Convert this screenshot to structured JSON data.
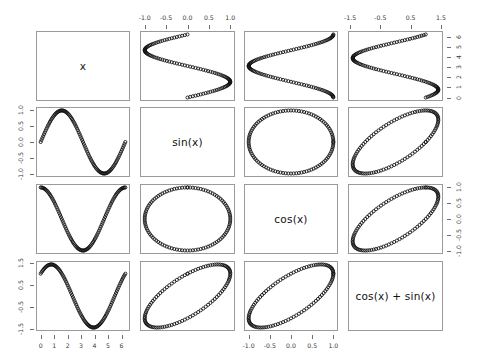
{
  "plot": {
    "type": "scatter-plot-matrix",
    "title": "",
    "variables": [
      "x",
      "sin(x)",
      "cos(x)",
      "cos(x) + sin(x)"
    ],
    "diagonal_labels": [
      "x",
      "sin(x)",
      "cos(x)",
      "cos(x) + sin(x)"
    ],
    "point_marker": "open-circle",
    "point_color": "#111111",
    "panel_border_color": "#9a9a9a",
    "background_color": "#ffffff"
  },
  "axes": {
    "col1_bottom": {
      "variable": "x",
      "labels": [
        "0",
        "1",
        "2",
        "3",
        "4",
        "5",
        "6"
      ],
      "values": [
        0,
        1,
        2,
        3,
        4,
        5,
        6
      ],
      "range": [
        -0.3,
        6.6
      ],
      "side": "bottom"
    },
    "col2_top": {
      "variable": "sin(x)",
      "labels": [
        "-1.0",
        "-0.5",
        "0.0",
        "0.5",
        "1.0"
      ],
      "values": [
        -1.0,
        -0.5,
        0.0,
        0.5,
        1.0
      ],
      "range": [
        -1.15,
        1.15
      ],
      "side": "top"
    },
    "col3_bottom": {
      "variable": "cos(x)",
      "labels": [
        "-1.0",
        "-0.5",
        "0.0",
        "0.5",
        "1.0"
      ],
      "values": [
        -1.0,
        -0.5,
        0.0,
        0.5,
        1.0
      ],
      "range": [
        -1.15,
        1.15
      ],
      "side": "bottom"
    },
    "col4_top": {
      "variable": "cos(x) + sin(x)",
      "labels": [
        "-1.5",
        "-0.5",
        "0.5",
        "1.5"
      ],
      "values": [
        -1.5,
        -0.5,
        0.5,
        1.5
      ],
      "range": [
        -1.55,
        1.55
      ],
      "side": "top"
    },
    "row1_right": {
      "variable": "x",
      "labels": [
        "0",
        "1",
        "2",
        "3",
        "4",
        "5",
        "6"
      ],
      "values": [
        0,
        1,
        2,
        3,
        4,
        5,
        6
      ],
      "range": [
        -0.3,
        6.6
      ],
      "side": "right"
    },
    "row2_left": {
      "variable": "sin(x)",
      "labels": [
        "1.0",
        "0.5",
        "0.0",
        "-0.5",
        "-1.0"
      ],
      "values": [
        1.0,
        0.5,
        0.0,
        -0.5,
        -1.0
      ],
      "range": [
        -1.15,
        1.15
      ],
      "side": "left"
    },
    "row3_right": {
      "variable": "cos(x)",
      "labels": [
        "1.0",
        "0.5",
        "0.0",
        "-0.5",
        "-1.0"
      ],
      "values": [
        1.0,
        0.5,
        0.0,
        -0.5,
        -1.0
      ],
      "range": [
        -1.15,
        1.15
      ],
      "side": "right"
    },
    "row4_left": {
      "variable": "cos(x) + sin(x)",
      "labels": [
        "1.5",
        "0.5",
        "-0.5",
        "-1.5"
      ],
      "values": [
        1.5,
        0.5,
        -0.5,
        -1.5
      ],
      "range": [
        -1.55,
        1.55
      ],
      "side": "left"
    }
  },
  "chart_data": {
    "type": "scatter",
    "xlabel": "",
    "ylabel": "",
    "grid": false,
    "legend": "none",
    "n_points": 101,
    "x_definition": "seq(0, 2*pi, length.out = 101)",
    "variables": [
      {
        "name": "x",
        "range": [
          0,
          6.283185
        ],
        "ticks": [
          0,
          1,
          2,
          3,
          4,
          5,
          6
        ]
      },
      {
        "name": "sin(x)",
        "range": [
          -1,
          1
        ],
        "ticks": [
          -1.0,
          -0.5,
          0.0,
          0.5,
          1.0
        ]
      },
      {
        "name": "cos(x)",
        "range": [
          -1,
          1
        ],
        "ticks": [
          -1.0,
          -0.5,
          0.0,
          0.5,
          1.0
        ]
      },
      {
        "name": "cos(x) + sin(x)",
        "range": [
          -1.414214,
          1.414214
        ],
        "ticks": [
          -1.5,
          -0.5,
          0.5,
          1.5
        ]
      }
    ],
    "series": [
      {
        "name": "x",
        "values": [
          0,
          0.062832,
          0.125664,
          0.188496,
          0.251327,
          0.314159,
          0.376991,
          0.439823,
          0.502655,
          0.565487,
          0.628319,
          0.69115,
          0.753982,
          0.816814,
          0.879646,
          0.942478,
          1.00531,
          1.068142,
          1.130973,
          1.193805,
          1.256637,
          1.319469,
          1.382301,
          1.445133,
          1.507964,
          1.570796,
          1.633628,
          1.69646,
          1.759292,
          1.822124,
          1.884956,
          1.947787,
          2.010619,
          2.073451,
          2.136283,
          2.199115,
          2.261947,
          2.324779,
          2.38761,
          2.450442,
          2.513274,
          2.576106,
          2.638938,
          2.70177,
          2.764601,
          2.827433,
          2.890265,
          2.953097,
          3.015929,
          3.078761,
          3.141593,
          3.204425,
          3.267256,
          3.330088,
          3.39292,
          3.455752,
          3.518584,
          3.581416,
          3.644247,
          3.707079,
          3.769911,
          3.832743,
          3.895575,
          3.958407,
          4.021239,
          4.08407,
          4.146902,
          4.209734,
          4.272566,
          4.335398,
          4.39823,
          4.461062,
          4.523893,
          4.586725,
          4.649557,
          4.712389,
          4.775221,
          4.838053,
          4.900885,
          4.963716,
          5.026548,
          5.08938,
          5.152212,
          5.215044,
          5.277876,
          5.340708,
          5.403539,
          5.466371,
          5.529203,
          5.592035,
          5.654867,
          5.717699,
          5.78053,
          5.843362,
          5.906194,
          5.969026,
          6.031858,
          6.09469,
          6.157522,
          6.220353,
          6.283185
        ]
      },
      {
        "name": "sin(x)",
        "formula": "sin(x)"
      },
      {
        "name": "cos(x)",
        "formula": "cos(x)"
      },
      {
        "name": "cos(x) + sin(x)",
        "formula": "cos(x) + sin(x)"
      }
    ],
    "panels": [
      {
        "row": 1,
        "col": 1,
        "kind": "diagonal",
        "label": "x"
      },
      {
        "row": 1,
        "col": 2,
        "kind": "scatter",
        "x": "sin(x)",
        "y": "x"
      },
      {
        "row": 1,
        "col": 3,
        "kind": "scatter",
        "x": "cos(x)",
        "y": "x"
      },
      {
        "row": 1,
        "col": 4,
        "kind": "scatter",
        "x": "cos(x) + sin(x)",
        "y": "x"
      },
      {
        "row": 2,
        "col": 1,
        "kind": "scatter",
        "x": "x",
        "y": "sin(x)"
      },
      {
        "row": 2,
        "col": 2,
        "kind": "diagonal",
        "label": "sin(x)"
      },
      {
        "row": 2,
        "col": 3,
        "kind": "scatter",
        "x": "cos(x)",
        "y": "sin(x)"
      },
      {
        "row": 2,
        "col": 4,
        "kind": "scatter",
        "x": "cos(x) + sin(x)",
        "y": "sin(x)"
      },
      {
        "row": 3,
        "col": 1,
        "kind": "scatter",
        "x": "x",
        "y": "cos(x)"
      },
      {
        "row": 3,
        "col": 2,
        "kind": "scatter",
        "x": "sin(x)",
        "y": "cos(x)"
      },
      {
        "row": 3,
        "col": 3,
        "kind": "diagonal",
        "label": "cos(x)"
      },
      {
        "row": 3,
        "col": 4,
        "kind": "scatter",
        "x": "cos(x) + sin(x)",
        "y": "cos(x)"
      },
      {
        "row": 4,
        "col": 1,
        "kind": "scatter",
        "x": "x",
        "y": "cos(x) + sin(x)"
      },
      {
        "row": 4,
        "col": 2,
        "kind": "scatter",
        "x": "sin(x)",
        "y": "cos(x) + sin(x)"
      },
      {
        "row": 4,
        "col": 3,
        "kind": "scatter",
        "x": "cos(x)",
        "y": "cos(x) + sin(x)"
      },
      {
        "row": 4,
        "col": 4,
        "kind": "diagonal",
        "label": "cos(x) + sin(x)"
      }
    ]
  }
}
